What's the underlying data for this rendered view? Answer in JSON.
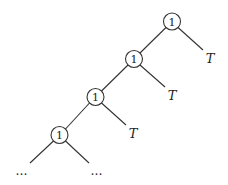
{
  "diagram": {
    "type": "binary-tree",
    "colors": {
      "stroke": "#333333",
      "text": "#222222",
      "background": "#ffffff"
    },
    "nodes": [
      {
        "id": "n1",
        "label": "1",
        "cx": 172,
        "cy": 21.5
      },
      {
        "id": "n2",
        "label": "1",
        "cx": 134,
        "cy": 59
      },
      {
        "id": "n3",
        "label": "1",
        "cx": 95.5,
        "cy": 97
      },
      {
        "id": "n4",
        "label": "1",
        "cx": 59.5,
        "cy": 135
      }
    ],
    "leaves": [
      {
        "id": "t1",
        "label": "T",
        "x": 210,
        "y": 63
      },
      {
        "id": "t2",
        "label": "T",
        "x": 172,
        "y": 100
      },
      {
        "id": "t3",
        "label": "T",
        "x": 133,
        "y": 138
      }
    ],
    "continuations": [
      {
        "id": "c1",
        "label": "…",
        "x": 22,
        "y": 175
      },
      {
        "id": "c2",
        "label": "…",
        "x": 97,
        "y": 175
      }
    ],
    "edges": [
      {
        "from": "n1",
        "to": "n2"
      },
      {
        "from": "n1",
        "to": "t1"
      },
      {
        "from": "n2",
        "to": "n3"
      },
      {
        "from": "n2",
        "to": "t2"
      },
      {
        "from": "n3",
        "to": "n4"
      },
      {
        "from": "n3",
        "to": "t3"
      },
      {
        "from": "n4",
        "to": "c1"
      },
      {
        "from": "n4",
        "to": "c2"
      }
    ]
  }
}
